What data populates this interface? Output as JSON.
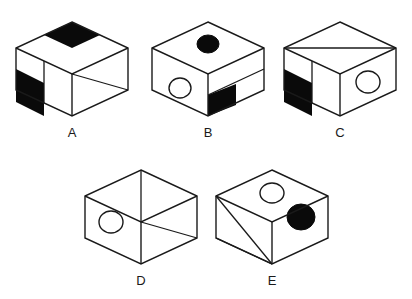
{
  "figure": {
    "kind": "cube-net-puzzle-figure",
    "background_color": "#ffffff",
    "line_color": "#1a1a1a",
    "fill_color": "#0a0a0a",
    "width": 412,
    "height": 299
  },
  "cubes": [
    {
      "id": "A",
      "label": "A",
      "label_x": 72,
      "label_y": 137,
      "center_x": 72,
      "center_y": 70,
      "top_face": "black-parallelogram-upper-right-quadrant",
      "left_face": "black-band-lower-left-with-vertical-divider",
      "right_face": "diagonal-from-top-left-to-bottom-right"
    },
    {
      "id": "B",
      "label": "B",
      "label_x": 208,
      "label_y": 137,
      "center_x": 208,
      "center_y": 70,
      "top_face": "solid-black-circle",
      "left_face": "open-circle",
      "right_face": "horizontal-divider-with-black-lower-left-square"
    },
    {
      "id": "C",
      "label": "C",
      "label_x": 340,
      "label_y": 137,
      "center_x": 340,
      "center_y": 70,
      "top_face": "diagonal-left-vertex-to-right-vertex",
      "left_face": "vertical-divider-with-black-lower-left-band",
      "right_face": "open-circle"
    },
    {
      "id": "D",
      "label": "D",
      "label_x": 141,
      "label_y": 285,
      "center_x": 141,
      "center_y": 218,
      "top_face": "diagonal-from-top-vertex-to-center",
      "left_face": "open-circle",
      "right_face": "diagonal-from-center-to-bottom-right"
    },
    {
      "id": "E",
      "label": "E",
      "label_x": 272,
      "label_y": 285,
      "center_x": 272,
      "center_y": 218,
      "top_face": "open-circle",
      "left_face": "two-diagonals-from-top-left-vertex",
      "right_face": "solid-black-circle"
    }
  ],
  "labels": {
    "a": "A",
    "b": "B",
    "c": "C",
    "d": "D",
    "e": "E"
  }
}
